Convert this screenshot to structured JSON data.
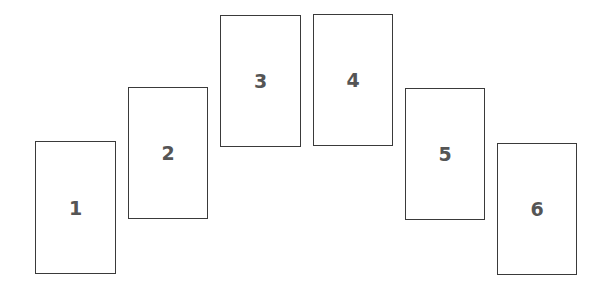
{
  "layout": "arched-card-spread",
  "border_color": "#3a3a3a",
  "text_color": "#555555",
  "cards": [
    {
      "label": "1",
      "x": 35,
      "y": 141,
      "w": 81,
      "h": 133
    },
    {
      "label": "2",
      "x": 128,
      "y": 87,
      "w": 80,
      "h": 132
    },
    {
      "label": "3",
      "x": 220,
      "y": 15,
      "w": 81,
      "h": 132
    },
    {
      "label": "4",
      "x": 313,
      "y": 14,
      "w": 80,
      "h": 132
    },
    {
      "label": "5",
      "x": 405,
      "y": 88,
      "w": 80,
      "h": 132
    },
    {
      "label": "6",
      "x": 497,
      "y": 143,
      "w": 80,
      "h": 132
    }
  ]
}
